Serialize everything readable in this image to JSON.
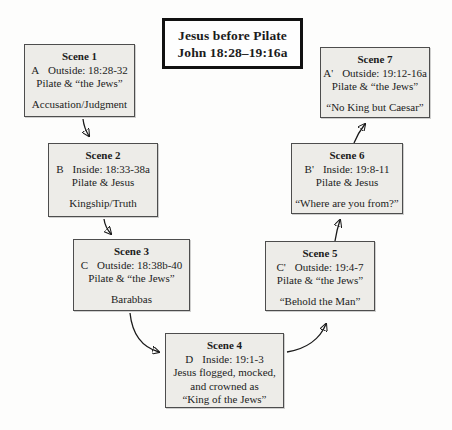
{
  "title": {
    "line1": "Jesus before Pilate",
    "line2": "John 18:28–19:16a"
  },
  "scenes": [
    {
      "name": "Scene 1",
      "marker": "A",
      "setting": "Outside: 18:28-32",
      "participants": "Pilate & “the Jews”",
      "theme": "Accusation/Judgment"
    },
    {
      "name": "Scene 2",
      "marker": "B",
      "setting": "Inside: 18:33-38a",
      "participants": "Pilate & Jesus",
      "theme": "Kingship/Truth"
    },
    {
      "name": "Scene 3",
      "marker": "C",
      "setting": "Outside: 18:38b-40",
      "participants": "Pilate & “the Jews”",
      "theme": "Barabbas"
    },
    {
      "name": "Scene 4",
      "marker": "D",
      "setting": "Inside: 19:1-3",
      "participants": "Jesus flogged, mocked,",
      "body2": "and crowned as",
      "theme": "“King of the Jews”"
    },
    {
      "name": "Scene 5",
      "marker": "C'",
      "setting": "Outside: 19:4-7",
      "participants": "Pilate & “the Jews”",
      "theme": "“Behold the Man”"
    },
    {
      "name": "Scene 6",
      "marker": "B'",
      "setting": "Inside: 19:8-11",
      "participants": "Pilate & Jesus",
      "theme": "“Where are you from?”"
    },
    {
      "name": "Scene 7",
      "marker": "A'",
      "setting": "Outside: 19:12-16a",
      "participants": "Pilate & “the Jews”",
      "theme": "“No King but Caesar”"
    }
  ],
  "colors": {
    "scene_box_fill": "#edece8",
    "scene_box_border": "#4d4d4d",
    "title_box_border": "#111111",
    "title_box_fill": "#fefefe",
    "arrow": "#1a1a1a",
    "text": "#1c1c1c",
    "background": "#fdfdfc"
  }
}
